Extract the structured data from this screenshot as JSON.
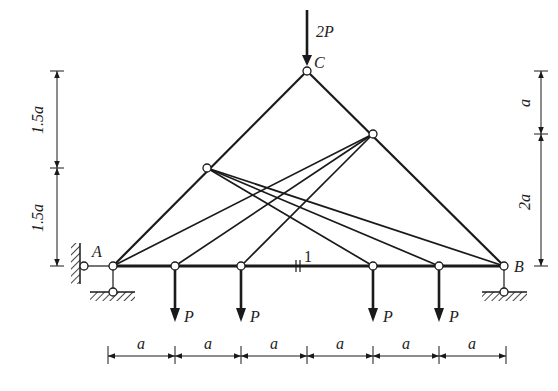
{
  "diagram": {
    "type": "truss-structure",
    "nodes": {
      "C": {
        "label": "C",
        "x": 307,
        "y": 71
      },
      "D": {
        "x": 373,
        "y": 134
      },
      "E": {
        "x": 207,
        "y": 168
      },
      "A": {
        "label": "A",
        "x": 113,
        "y": 266
      },
      "N1": {
        "x": 175,
        "y": 266
      },
      "N2": {
        "x": 241,
        "y": 266
      },
      "N3": {
        "x": 373,
        "y": 266
      },
      "N4": {
        "x": 439,
        "y": 266
      },
      "B": {
        "label": "B",
        "x": 504,
        "y": 266
      }
    },
    "loads": {
      "top": "2P",
      "bottom": [
        "P",
        "P",
        "P",
        "P"
      ]
    },
    "member_label": "1",
    "dimensions": {
      "left": [
        "1.5a",
        "1.5a"
      ],
      "right": [
        "a",
        "2a"
      ],
      "bottom": [
        "a",
        "a",
        "a",
        "a",
        "a",
        "a"
      ]
    },
    "colors": {
      "line": "#1a1a1a",
      "background": "#ffffff"
    }
  }
}
